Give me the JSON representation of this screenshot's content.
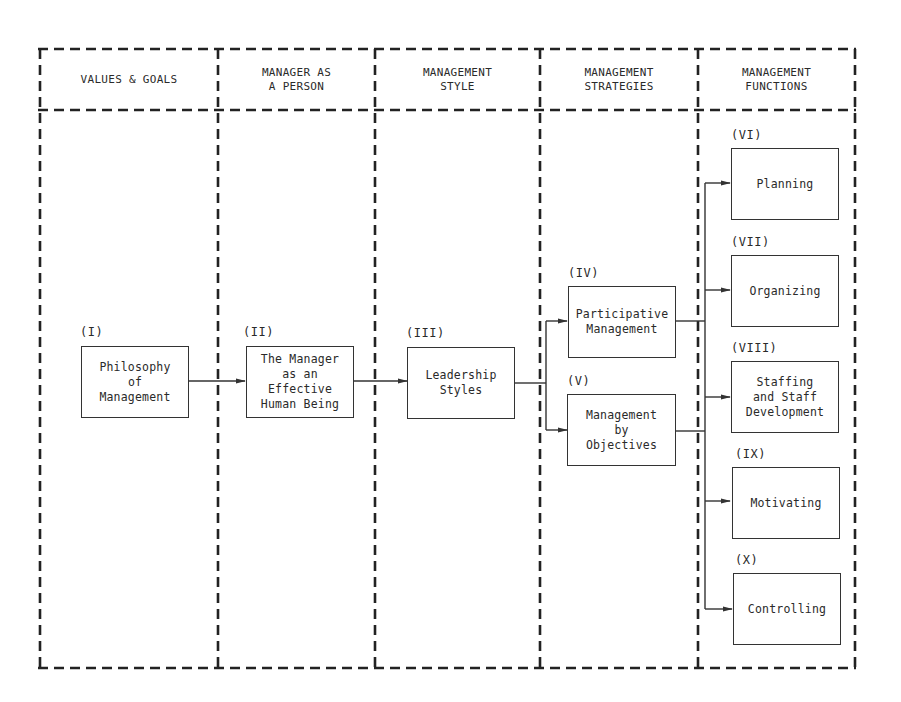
{
  "headers": [
    {
      "label": "VALUES & GOALS"
    },
    {
      "label": "MANAGER AS\nA PERSON"
    },
    {
      "label": "MANAGEMENT\nSTYLE"
    },
    {
      "label": "MANAGEMENT\nSTRATEGIES"
    },
    {
      "label": "MANAGEMENT\nFUNCTIONS"
    }
  ],
  "nodes": [
    {
      "id": "I",
      "number": "(I)",
      "label": "Philosophy\nof\nManagement"
    },
    {
      "id": "II",
      "number": "(II)",
      "label": "The Manager\nas an\nEffective\nHuman Being"
    },
    {
      "id": "III",
      "number": "(III)",
      "label": "Leadership\nStyles"
    },
    {
      "id": "IV",
      "number": "(IV)",
      "label": "Participative\nManagement"
    },
    {
      "id": "V",
      "number": "(V)",
      "label": "Management\nby\nObjectives"
    },
    {
      "id": "VI",
      "number": "(VI)",
      "label": "Planning"
    },
    {
      "id": "VII",
      "number": "(VII)",
      "label": "Organizing"
    },
    {
      "id": "VIII",
      "number": "(VIII)",
      "label": "Staffing\nand Staff\nDevelopment"
    },
    {
      "id": "IX",
      "number": "(IX)",
      "label": "Motivating"
    },
    {
      "id": "X",
      "number": "(X)",
      "label": "Controlling"
    }
  ],
  "edges": [
    {
      "from": "I",
      "to": "II"
    },
    {
      "from": "II",
      "to": "III"
    },
    {
      "from": "III",
      "to": "IV"
    },
    {
      "from": "III",
      "to": "V"
    },
    {
      "from": "IV",
      "to": "VI"
    },
    {
      "from": "IV",
      "to": "VII"
    },
    {
      "from": "IV",
      "to": "VIII"
    },
    {
      "from": "IV",
      "to": "IX"
    },
    {
      "from": "IV",
      "to": "X"
    },
    {
      "from": "V",
      "to": "VI"
    },
    {
      "from": "V",
      "to": "VII"
    },
    {
      "from": "V",
      "to": "VIII"
    },
    {
      "from": "V",
      "to": "IX"
    },
    {
      "from": "V",
      "to": "X"
    }
  ],
  "colors": {
    "line": "#333333",
    "background": "#ffffff",
    "text": "#2a2a2a"
  }
}
